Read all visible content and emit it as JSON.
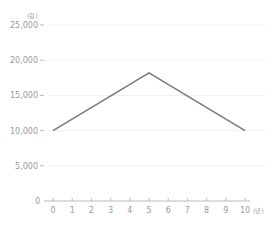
{
  "chart_data": {
    "type": "line",
    "title": "",
    "xlabel": "",
    "ylabel": "",
    "x_unit": "(년)",
    "y_unit": "(원)",
    "x": [
      0,
      5,
      10
    ],
    "series": [
      {
        "name": "value",
        "values": [
          10000,
          18200,
          10000
        ],
        "color": "#7a7a7a"
      }
    ],
    "x_ticks": [
      "0",
      "1",
      "2",
      "3",
      "4",
      "5",
      "6",
      "7",
      "8",
      "9",
      "10"
    ],
    "y_ticks": [
      "0",
      "5,000",
      "10,000",
      "15,000",
      "20,000",
      "25,000"
    ],
    "xlim": [
      0,
      10
    ],
    "ylim": [
      0,
      25000
    ],
    "grid": "faint horizontal",
    "legend": "none"
  }
}
